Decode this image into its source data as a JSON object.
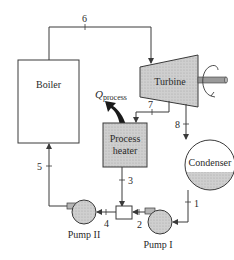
{
  "diagram": {
    "type": "cogeneration-cycle-schematic",
    "components": {
      "boiler": {
        "label": "Boiler"
      },
      "turbine": {
        "label": "Turbine"
      },
      "process_heater": {
        "label_line1": "Process",
        "label_line2": "heater"
      },
      "condenser": {
        "label": "Condenser"
      },
      "pump_1": {
        "label": "Pump I"
      },
      "pump_2": {
        "label": "Pump II"
      },
      "mixing_chamber": {
        "label": ""
      }
    },
    "heat_flow": {
      "symbol": "Q",
      "subscript": "process"
    },
    "state_points": {
      "s1": "1",
      "s2": "2",
      "s3": "3",
      "s4": "4",
      "s5": "5",
      "s6": "6",
      "s7": "7",
      "s8": "8"
    },
    "colors": {
      "line": "#3a3a3a",
      "fill_gray": "#c9c9c9",
      "arrow_black": "#1a1a1a"
    }
  }
}
